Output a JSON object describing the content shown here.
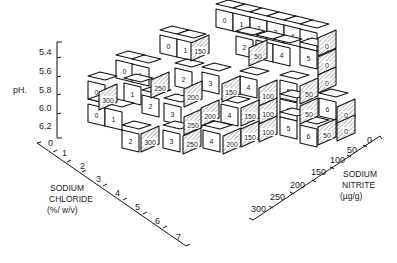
{
  "chart_data": {
    "type": "3d-block",
    "title": "",
    "axes": {
      "ph": {
        "label": "pH",
        "ticks": [
          "5.4",
          "5.6",
          "5.8",
          "6.0",
          "6.2"
        ]
      },
      "sodium_chloride": {
        "label_lines": [
          "SODIUM",
          "CHLORIDE",
          "(%/ w/v)"
        ],
        "ticks": [
          "0",
          "1",
          "2",
          "3",
          "4",
          "5",
          "6",
          "7"
        ]
      },
      "sodium_nitrite": {
        "label_lines": [
          "SODIUM",
          "NITRITE",
          "(µg/g)"
        ],
        "ticks": [
          "0",
          "50",
          "100",
          "150",
          "200",
          "250",
          "300"
        ]
      }
    },
    "front_face_labels": {
      "row_5_4": [
        "0",
        "1",
        "2",
        "3",
        "4",
        "5"
      ],
      "row_5_6": [
        "0",
        "1",
        "2",
        "3",
        "4",
        "5"
      ],
      "row_5_8": [
        "0",
        "1",
        "2",
        "3",
        "4",
        "5"
      ],
      "row_6_0": [
        "0",
        "1",
        "2",
        "3",
        "4",
        "5",
        "6"
      ],
      "row_6_2": [
        "0",
        "1",
        "2",
        "3",
        "4",
        "5",
        "6"
      ]
    },
    "side_face_labels": {
      "row_5_4": [
        "150",
        "50",
        "0"
      ],
      "row_5_6": [
        "250",
        "200",
        "150",
        "100",
        "50",
        "0"
      ],
      "row_5_8": [
        "300",
        "250",
        "200",
        "150",
        "100",
        "50",
        "0"
      ],
      "row_6_0": [
        "300",
        "250",
        "200",
        "150",
        "100",
        "50",
        "0"
      ],
      "row_6_2": [
        "300",
        "250",
        "200",
        "150",
        "100",
        "50"
      ]
    }
  },
  "ph_axis": {
    "label": "pH.",
    "ticks": [
      "5.4",
      "5.6",
      "5.8",
      "6.0",
      "6.2"
    ]
  },
  "nacl_axis": {
    "title1": "SODIUM",
    "title2": "CHLORIDE",
    "title3": "(%/ w/v)",
    "ticks": [
      "0",
      "1",
      "2",
      "3",
      "4",
      "5",
      "6",
      "7"
    ]
  },
  "nitrite_axis": {
    "title1": "SODIUM",
    "title2": "NITRITE",
    "title3": "(µg/g)",
    "ticks": [
      "0",
      "50",
      "100",
      "150",
      "200",
      "250",
      "300"
    ]
  },
  "cubes": [
    {
      "t": "0",
      "x": 224,
      "y": 18
    },
    {
      "t": "1",
      "x": 241,
      "y": 22
    },
    {
      "t": "2",
      "x": 258,
      "y": 26
    },
    {
      "t": "3",
      "x": 275,
      "y": 30
    },
    {
      "t": "4",
      "x": 292,
      "y": 34
    },
    {
      "t": "5",
      "x": 308,
      "y": 38
    },
    {
      "t": "0",
      "x": 168,
      "y": 44
    },
    {
      "t": "1",
      "x": 185,
      "y": 48
    },
    {
      "t": "2",
      "x": 244,
      "y": 45
    },
    {
      "t": "3",
      "x": 264,
      "y": 49
    },
    {
      "t": "4",
      "x": 281,
      "y": 53
    },
    {
      "t": "5",
      "x": 308,
      "y": 56
    },
    {
      "t": "0",
      "x": 124,
      "y": 69
    },
    {
      "t": "1",
      "x": 140,
      "y": 73
    },
    {
      "t": "2",
      "x": 183,
      "y": 77
    },
    {
      "t": "3",
      "x": 210,
      "y": 81
    },
    {
      "t": "4",
      "x": 248,
      "y": 85
    },
    {
      "t": "5",
      "x": 288,
      "y": 89
    },
    {
      "t": "0",
      "x": 96,
      "y": 90
    },
    {
      "t": "1",
      "x": 132,
      "y": 92
    },
    {
      "t": "2",
      "x": 150,
      "y": 104
    },
    {
      "t": "3",
      "x": 172,
      "y": 112
    },
    {
      "t": "4",
      "x": 229,
      "y": 113
    },
    {
      "t": "5",
      "x": 288,
      "y": 108
    },
    {
      "t": "6",
      "x": 327,
      "y": 107
    },
    {
      "t": "0",
      "x": 96,
      "y": 113
    },
    {
      "t": "1",
      "x": 113,
      "y": 117
    },
    {
      "t": "2",
      "x": 130,
      "y": 139
    },
    {
      "t": "3",
      "x": 171,
      "y": 139
    },
    {
      "t": "4",
      "x": 211,
      "y": 139
    },
    {
      "t": "5",
      "x": 288,
      "y": 126
    },
    {
      "t": "6",
      "x": 308,
      "y": 134
    }
  ],
  "sides": [
    {
      "t": "150",
      "x": 200,
      "y": 48
    },
    {
      "t": "50",
      "x": 258,
      "y": 53
    },
    {
      "t": "0",
      "x": 327,
      "y": 43
    },
    {
      "t": "0",
      "x": 327,
      "y": 62
    },
    {
      "t": "0",
      "x": 327,
      "y": 80
    },
    {
      "t": "250",
      "x": 160,
      "y": 85
    },
    {
      "t": "200",
      "x": 193,
      "y": 94
    },
    {
      "t": "150",
      "x": 231,
      "y": 89
    },
    {
      "t": "100",
      "x": 268,
      "y": 93
    },
    {
      "t": "50",
      "x": 309,
      "y": 91
    },
    {
      "t": "300",
      "x": 108,
      "y": 97
    },
    {
      "t": "250",
      "x": 193,
      "y": 122
    },
    {
      "t": "200",
      "x": 210,
      "y": 113
    },
    {
      "t": "150",
      "x": 250,
      "y": 113
    },
    {
      "t": "100",
      "x": 268,
      "y": 111
    },
    {
      "t": "50",
      "x": 309,
      "y": 111
    },
    {
      "t": "0",
      "x": 346,
      "y": 112
    },
    {
      "t": "300",
      "x": 150,
      "y": 139
    },
    {
      "t": "250",
      "x": 192,
      "y": 141
    },
    {
      "t": "200",
      "x": 232,
      "y": 141
    },
    {
      "t": "150",
      "x": 250,
      "y": 134
    },
    {
      "t": "100",
      "x": 268,
      "y": 129
    },
    {
      "t": "50",
      "x": 327,
      "y": 132
    },
    {
      "t": "0",
      "x": 346,
      "y": 128
    }
  ]
}
